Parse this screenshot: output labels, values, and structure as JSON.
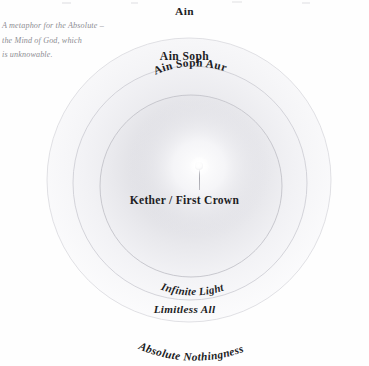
{
  "diagram": {
    "caption": {
      "lines": [
        "A metaphor for the Absolute –",
        "the Mind of God, which",
        "is unknowable."
      ]
    },
    "labels": {
      "ain": "Ain",
      "ain_soph": "Ain Soph",
      "ain_soph_aur": "Ain Soph Aur",
      "kether": "Kether / First Crown",
      "infinite_light": "Infinite Light",
      "limitless_all": "Limitless All",
      "absolute_nothingness": "Absolute Nothingness"
    },
    "rings": [
      {
        "name": "ain",
        "outer_label": "Ain",
        "inner_label": "Absolute Nothingness"
      },
      {
        "name": "ain-soph",
        "outer_label": "Ain Soph",
        "inner_label": "Limitless All"
      },
      {
        "name": "ain-soph-aur",
        "outer_label": "Ain Soph Aur",
        "inner_label": "Infinite Light"
      }
    ],
    "center_point": {
      "name": "kether-point",
      "label": "Kether / First Crown"
    },
    "colors": {
      "background": "#fefefe",
      "ring_stroke": "#c3c3ca",
      "ring_fill_outer": "#f7f7f8",
      "ring_fill_inner": "#ededf0",
      "text": "#1d1d1f",
      "caption_text": "#8d8d93",
      "spark": "#ffffff"
    }
  }
}
